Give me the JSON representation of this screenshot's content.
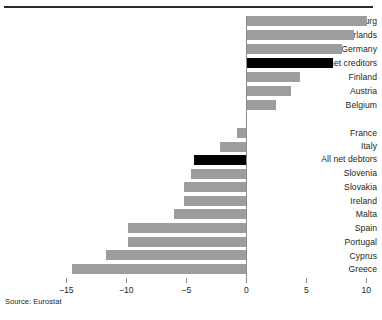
{
  "figure": {
    "source_note": "Source: Eurostat",
    "bar_color": "#9d9d9d",
    "highlight_color": "#000000",
    "axis_color": "#8c8c8c",
    "rule_color": "#2b2b2b"
  },
  "chart_data": {
    "type": "bar",
    "orientation": "horizontal",
    "title": "",
    "subtitle": "",
    "xlabel": "",
    "ylabel": "",
    "xlim": [
      -15,
      10
    ],
    "xticks": [
      -15,
      -10,
      -5,
      0,
      5,
      10
    ],
    "xtick_labels": [
      "−15",
      "−10",
      "−5",
      "0",
      "5",
      "10"
    ],
    "grid": false,
    "legend": null,
    "annotations": [
      "Source: Eurostat"
    ],
    "groups": [
      {
        "name": "net creditors",
        "categories": [
          "Luxembourg",
          "Netherlands",
          "Germany",
          "All net creditors",
          "Finland",
          "Austria",
          "Belgium"
        ],
        "values": [
          10.1,
          9.0,
          8.0,
          7.2,
          4.5,
          3.7,
          2.5
        ],
        "highlighted": [
          "All net creditors"
        ]
      },
      {
        "name": "net debtors",
        "categories": [
          "France",
          "Italy",
          "All net debtors",
          "Slovenia",
          "Slovakia",
          "Ireland",
          "Malta",
          "Spain",
          "Portugal",
          "Cyprus",
          "Greece"
        ],
        "values": [
          -0.8,
          -2.2,
          -4.35,
          -4.6,
          -5.2,
          -5.2,
          -6.0,
          -9.85,
          -9.9,
          -11.7,
          -14.5
        ],
        "highlighted": [
          "All net debtors"
        ]
      }
    ],
    "categories": [
      "Luxembourg",
      "Netherlands",
      "Germany",
      "All net creditors",
      "Finland",
      "Austria",
      "Belgium",
      "France",
      "Italy",
      "All net debtors",
      "Slovenia",
      "Slovakia",
      "Ireland",
      "Malta",
      "Spain",
      "Portugal",
      "Cyprus",
      "Greece"
    ],
    "values": [
      10.1,
      9.0,
      8.0,
      7.2,
      4.5,
      3.7,
      2.5,
      -0.8,
      -2.2,
      -4.35,
      -4.6,
      -5.2,
      -5.2,
      -6.0,
      -9.85,
      -9.9,
      -11.7,
      -14.5
    ]
  }
}
